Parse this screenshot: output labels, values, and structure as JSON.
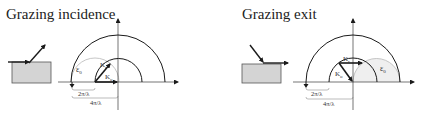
{
  "panels": [
    {
      "title": "Grazing incidence",
      "labels": {
        "epsilon": "ε",
        "epsilon_sub": "0",
        "k_r": "K",
        "k_r_sub": "r",
        "k_o": "K",
        "k_o_sub": "o",
        "small_radius": "2π/λ",
        "large_radius": "4π/λ"
      }
    },
    {
      "title": "Grazing exit",
      "labels": {
        "epsilon": "ε",
        "epsilon_sub": "0",
        "k_r": "K",
        "k_r_sub": "r",
        "k_o": "K",
        "k_o_sub": "o",
        "small_radius": "2π/λ",
        "large_radius": "4π/λ"
      }
    }
  ],
  "colors": {
    "line": "#1a1a1a",
    "ewald_circle": "#b8b8b8",
    "sample_fill": "#d4d4d4",
    "sample_border": "#555555"
  }
}
